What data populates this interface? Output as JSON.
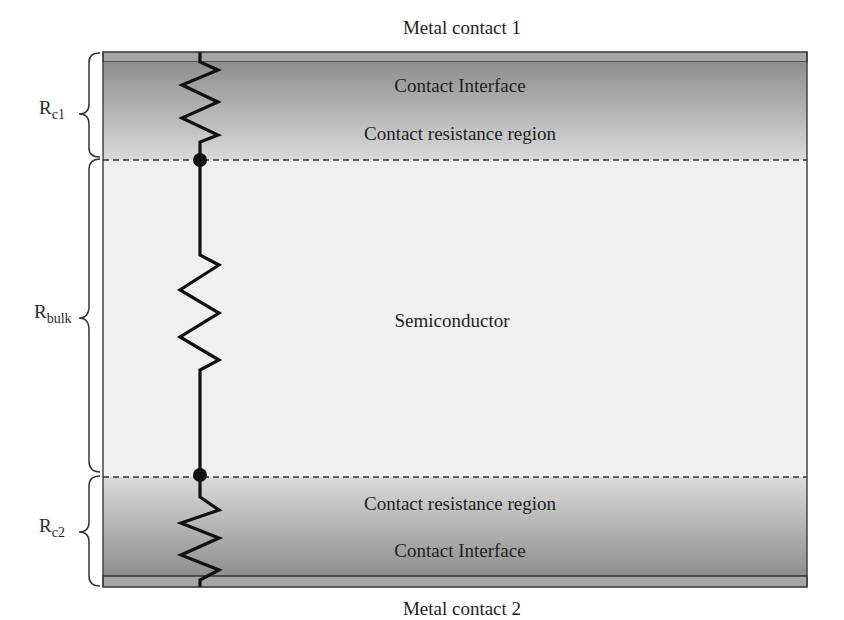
{
  "diagram": {
    "top_label": "Metal contact 1",
    "bottom_label": "Metal contact 2",
    "regions": {
      "top_interface": "Contact Interface",
      "top_resistance": "Contact resistance region",
      "bulk": "Semiconductor",
      "bottom_resistance": "Contact resistance region",
      "bottom_interface": "Contact Interface"
    },
    "resistors": {
      "rc1": {
        "main": "R",
        "sub": "c1"
      },
      "rbulk": {
        "main": "R",
        "sub": "bulk"
      },
      "rc2": {
        "main": "R",
        "sub": "c2"
      }
    },
    "colors": {
      "contact_dark": "#8f8f8f",
      "contact_light": "#d6d6d6",
      "metal_strip": "#a8a8a8",
      "bulk_fill": "#f1f1f1",
      "wire": "#111111"
    }
  }
}
